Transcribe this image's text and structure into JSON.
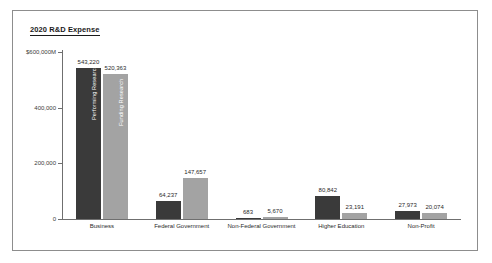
{
  "chart_data": {
    "type": "bar",
    "title": "2020 R&D Expense",
    "xlabel": "",
    "ylabel": "",
    "ylim": [
      0,
      600000
    ],
    "grid": false,
    "legend": "in-bar labels on first group",
    "y_ticks": [
      {
        "value": 600000,
        "label": "$600,000M"
      },
      {
        "value": 400000,
        "label": "400,000"
      },
      {
        "value": 200000,
        "label": "200,000"
      },
      {
        "value": 0,
        "label": "0"
      }
    ],
    "categories": [
      "Business",
      "Federal Government",
      "Non-Federal Government",
      "Higher Education",
      "Non-Profit"
    ],
    "series": [
      {
        "name": "Performing Research",
        "color": "#3a3a3a",
        "values": [
          543220,
          64237,
          683,
          80842,
          27973
        ],
        "labels": [
          "543,220",
          "64,237",
          "683",
          "80,842",
          "27,973"
        ]
      },
      {
        "name": "Funding Research",
        "color": "#a3a3a3",
        "values": [
          520363,
          147657,
          5670,
          23191,
          20074
        ],
        "labels": [
          "520,363",
          "147,657",
          "5,670",
          "23,191",
          "20,074"
        ]
      }
    ]
  }
}
